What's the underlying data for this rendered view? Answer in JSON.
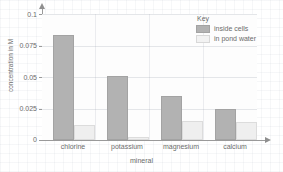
{
  "chart_data": {
    "type": "bar",
    "title": "",
    "xlabel": "mineral",
    "ylabel": "concentration in M",
    "categories": [
      "chlorine",
      "potassium",
      "magnesium",
      "calcium"
    ],
    "series": [
      {
        "name": "inside cells",
        "values": [
          0.083,
          0.051,
          0.035,
          0.025
        ],
        "color": "#b2b2b2"
      },
      {
        "name": "in pond water",
        "values": [
          0.012,
          0.002,
          0.015,
          0.014
        ],
        "color": "#efefef"
      }
    ],
    "ylim": [
      0,
      0.1
    ],
    "yticks": [
      0,
      0.025,
      0.05,
      0.075,
      0.1
    ],
    "ytick_labels": [
      "0",
      "0.025",
      "0.05",
      "0.075",
      "0.1"
    ],
    "grid": true,
    "legend_position": "top-right"
  },
  "legend": {
    "title": "Key",
    "entries": [
      "inside cells",
      "in pond water"
    ]
  },
  "axes": {
    "y_title": "concentration in M",
    "x_title": "mineral"
  }
}
